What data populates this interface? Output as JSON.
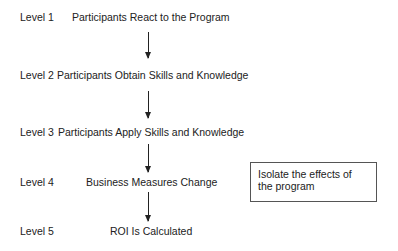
{
  "levels": [
    {
      "label": "Level 1",
      "text": "Participants React to the Program"
    },
    {
      "label": "Level 2",
      "text": "Participants Obtain Skills and Knowledge"
    },
    {
      "label": "Level 3",
      "text": "Participants Apply Skills and Knowledge"
    },
    {
      "label": "Level 4",
      "text": "Business Measures Change"
    },
    {
      "label": "Level 5",
      "text": "ROI Is Calculated"
    }
  ],
  "side_box": {
    "text": "Isolate the effects of the program"
  },
  "colors": {
    "line": "#222222",
    "background": "#ffffff"
  }
}
